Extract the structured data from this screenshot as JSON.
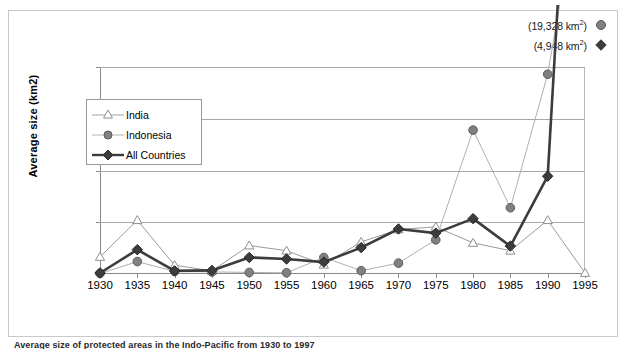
{
  "axis": {
    "ylabel": "Average size (km2)",
    "yticks": [
      0,
      500,
      1000,
      1500,
      2000
    ],
    "xticks": [
      1930,
      1935,
      1940,
      1945,
      1950,
      1955,
      1960,
      1965,
      1970,
      1975,
      1980,
      1985,
      1990,
      1995
    ]
  },
  "legend": {
    "items": [
      {
        "label": "India",
        "marker": "triangle-open-icon",
        "color": "#a0a0a0"
      },
      {
        "label": "Indonesia",
        "marker": "circle-filled-icon",
        "color": "#808080"
      },
      {
        "label": "All Countries",
        "marker": "diamond-filled-icon",
        "color": "#3c3c3c"
      }
    ]
  },
  "annotations": [
    {
      "text": "(19,328 km²)",
      "value": "19,328",
      "unit": "km2",
      "marker": "circle-filled-icon",
      "series": "Indonesia"
    },
    {
      "text": "(4,948 km²)",
      "value": "4,948",
      "unit": "km2",
      "marker": "diamond-filled-icon",
      "series": "All Countries"
    }
  ],
  "caption": {
    "text": "Average size of protected areas in the Indo-Pacific from 1930 to 1997"
  },
  "chart_data": {
    "type": "line",
    "title": "",
    "xlabel": "",
    "ylabel": "Average size (km2)",
    "xlim": [
      1930,
      1995
    ],
    "ylim": [
      0,
      2000
    ],
    "grid": true,
    "legend_position": "inside-upper-left",
    "x": [
      1930,
      1935,
      1940,
      1945,
      1950,
      1955,
      1960,
      1965,
      1970,
      1975,
      1980,
      1985,
      1990,
      1995
    ],
    "series": [
      {
        "name": "India",
        "marker": "triangle-open",
        "color": "#a0a0a0",
        "line_width": 1,
        "values": [
          165,
          520,
          85,
          30,
          275,
          225,
          90,
          310,
          430,
          455,
          300,
          225,
          520,
          10
        ]
      },
      {
        "name": "Indonesia",
        "marker": "circle-filled",
        "color": "#808080",
        "line_width": 1,
        "values": [
          5,
          120,
          25,
          20,
          15,
          12,
          160,
          32,
          105,
          330,
          1390,
          640,
          1930,
          null
        ],
        "offscale_note": "(19,328 km²)"
      },
      {
        "name": "All Countries",
        "marker": "diamond-filled",
        "color": "#3c3c3c",
        "line_width": 2.6,
        "values": [
          10,
          235,
          30,
          35,
          160,
          145,
          115,
          255,
          435,
          395,
          535,
          270,
          945,
          null
        ],
        "offscale_note": "(4,948 km²)"
      }
    ]
  }
}
